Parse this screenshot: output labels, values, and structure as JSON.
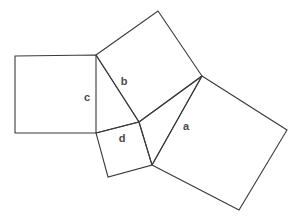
{
  "figure": {
    "background_color": "#ffffff",
    "stroke_color": "#3a3a3a",
    "label_color": "#4a4a4a",
    "canvas": {
      "width": 295,
      "height": 223
    },
    "squares": [
      {
        "id": "square-c",
        "label": "c",
        "points": "15,56 96,55 96,133 15,133"
      },
      {
        "id": "square-b",
        "label": "b",
        "points": "96,55 158,11 202,76 139,122"
      },
      {
        "id": "square-d",
        "label": "d",
        "points": "96,133 139,122 152,165 108,177"
      },
      {
        "id": "square-a",
        "label": "a",
        "points": "202,76 287,130 239,210 152,165"
      }
    ],
    "connectors": [
      {
        "id": "connector-c-inner",
        "d": "M 96,55 L 139,122"
      },
      {
        "id": "connector-b-inner",
        "d": "M 139,122 L 202,76"
      },
      {
        "id": "connector-d-upper",
        "d": "M 96,133 L 139,122"
      },
      {
        "id": "connector-d-lower",
        "d": "M 139,122 L 152,165"
      },
      {
        "id": "connector-a-inner",
        "d": "M 202,76 L 152,165"
      }
    ],
    "labels": [
      {
        "id": "label-a",
        "text": "a",
        "x": 186,
        "y": 126
      },
      {
        "id": "label-b",
        "text": "b",
        "x": 124,
        "y": 81
      },
      {
        "id": "label-c",
        "text": "c",
        "x": 87,
        "y": 97
      },
      {
        "id": "label-d",
        "text": "d",
        "x": 122,
        "y": 138
      }
    ]
  }
}
